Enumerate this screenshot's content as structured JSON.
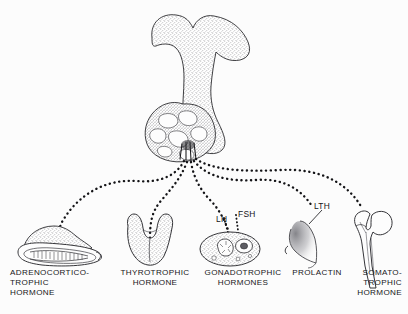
{
  "figure": {
    "background_color": "#fcfcfc",
    "ink_color": "#1b1b1e"
  },
  "source_gland": {
    "name": "pituitary-gland",
    "parts": [
      "anterior lobe",
      "posterior lobe",
      "infundibular stalk"
    ]
  },
  "tracers": [
    {
      "id": "lh",
      "label": "LH",
      "x": 216,
      "y": 214
    },
    {
      "id": "fsh",
      "label": "FSH",
      "x": 238,
      "y": 209
    },
    {
      "id": "lth",
      "label": "LTH",
      "x": 314,
      "y": 201
    }
  ],
  "targets": [
    {
      "id": "adrenal",
      "organ": "adrenal-gland-on-kidney",
      "hormone": "ADRENOCORTICO-\nTROPHIC\nHORMONE",
      "align": "left",
      "x": 10,
      "y": 268,
      "width": 110
    },
    {
      "id": "thyroid",
      "organ": "thyroid-gland",
      "hormone": "THYROTROPHIC\nHORMONE",
      "align": "center",
      "x": 112,
      "y": 268,
      "width": 86
    },
    {
      "id": "gonad",
      "organ": "ovary",
      "hormone": "GONADOTROPHIC\nHORMONES",
      "align": "center",
      "x": 196,
      "y": 268,
      "width": 94
    },
    {
      "id": "mammary",
      "organ": "mammary-gland",
      "hormone": "PROLACTIN",
      "align": "center",
      "x": 286,
      "y": 268,
      "width": 62
    },
    {
      "id": "bone",
      "organ": "femur",
      "hormone": "SOMATO-\nTROPHIC\nHORMONE",
      "align": "right",
      "x": 336,
      "y": 268,
      "width": 66
    }
  ]
}
